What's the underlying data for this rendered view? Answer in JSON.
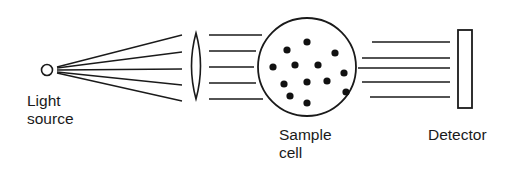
{
  "figure": {
    "kind": "optical-schematic",
    "title_visible": false,
    "background_color": "#ffffff",
    "line_color": "#1a1a1a",
    "dot_color": "#111111",
    "width": 529,
    "height": 175
  },
  "labels": {
    "light_source_line1": "Light",
    "light_source_line2": "source",
    "sample_cell_line1": "Sample",
    "sample_cell_line2": "cell",
    "detector": "Detector"
  },
  "components": {
    "light_source": {
      "icon_name": "light-source-circle",
      "cx": 47,
      "cy": 70,
      "r": 5.5,
      "stroke_width": 1.6,
      "filled": false
    },
    "lens": {
      "icon_name": "biconvex-lens",
      "cx": 196,
      "cy": 66,
      "half_height": 33,
      "bulge": 9,
      "stroke_width": 1.6
    },
    "sample_cell": {
      "icon_name": "sample-cell-circle",
      "cx": 307,
      "cy": 67,
      "r": 49,
      "stroke_width": 1.8
    },
    "detector": {
      "icon_name": "detector-plate",
      "x": 458,
      "y": 30,
      "width": 14,
      "height": 78,
      "stroke_width": 1.8
    }
  },
  "rays": {
    "diverging_count": 5,
    "diverging_stroke_width": 1.3,
    "diverging": [
      {
        "x1": 57,
        "y1": 67,
        "x2": 182,
        "y2": 35
      },
      {
        "x1": 57,
        "y1": 68,
        "x2": 182,
        "y2": 52
      },
      {
        "x1": 57,
        "y1": 70,
        "x2": 182,
        "y2": 69
      },
      {
        "x1": 57,
        "y1": 72,
        "x2": 182,
        "y2": 85
      },
      {
        "x1": 57,
        "y1": 73,
        "x2": 182,
        "y2": 101
      }
    ],
    "parallel_left_count": 5,
    "parallel_left_stroke_width": 1.5,
    "parallel_left": [
      {
        "x1": 209,
        "y1": 35,
        "x2": 262,
        "y2": 35
      },
      {
        "x1": 209,
        "y1": 51,
        "x2": 256,
        "y2": 51
      },
      {
        "x1": 209,
        "y1": 67,
        "x2": 254,
        "y2": 67
      },
      {
        "x1": 209,
        "y1": 83,
        "x2": 256,
        "y2": 83
      },
      {
        "x1": 209,
        "y1": 99,
        "x2": 263,
        "y2": 99
      }
    ],
    "parallel_right_count": 5,
    "parallel_right_stroke_width": 1.5,
    "parallel_right": [
      {
        "x1": 372,
        "y1": 42,
        "x2": 450,
        "y2": 42
      },
      {
        "x1": 362,
        "y1": 58,
        "x2": 450,
        "y2": 58
      },
      {
        "x1": 358,
        "y1": 68,
        "x2": 450,
        "y2": 68
      },
      {
        "x1": 362,
        "y1": 82,
        "x2": 450,
        "y2": 82
      },
      {
        "x1": 370,
        "y1": 97,
        "x2": 450,
        "y2": 97
      }
    ]
  },
  "particles": {
    "count": 13,
    "radius": 3.6,
    "positions": [
      {
        "cx": 307,
        "cy": 42
      },
      {
        "cx": 287,
        "cy": 50
      },
      {
        "cx": 335,
        "cy": 53
      },
      {
        "cx": 273,
        "cy": 67
      },
      {
        "cx": 295,
        "cy": 65
      },
      {
        "cx": 318,
        "cy": 65
      },
      {
        "cx": 344,
        "cy": 73
      },
      {
        "cx": 284,
        "cy": 84
      },
      {
        "cx": 307,
        "cy": 82
      },
      {
        "cx": 327,
        "cy": 81
      },
      {
        "cx": 346,
        "cy": 92
      },
      {
        "cx": 290,
        "cy": 96
      },
      {
        "cx": 307,
        "cy": 103
      }
    ]
  },
  "label_positions": {
    "light_source_line1": {
      "x": 27,
      "y": 106
    },
    "light_source_line2": {
      "x": 27,
      "y": 124
    },
    "sample_cell_line1": {
      "x": 279,
      "y": 140
    },
    "sample_cell_line2": {
      "x": 279,
      "y": 158
    },
    "detector": {
      "x": 428,
      "y": 140
    }
  }
}
